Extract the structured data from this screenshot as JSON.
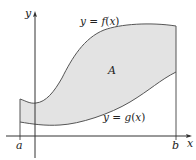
{
  "diagram": {
    "title": "",
    "labels": {
      "y_axis": "y",
      "x_axis": "x",
      "f_curve": "y = f(x)",
      "g_curve": "y = g(x)",
      "region": "A",
      "left_bound": "a",
      "right_bound": "b"
    },
    "colors": {
      "region_fill": "#e3e3e3",
      "curve_stroke": "#555555",
      "axis_stroke": "#333333"
    }
  }
}
